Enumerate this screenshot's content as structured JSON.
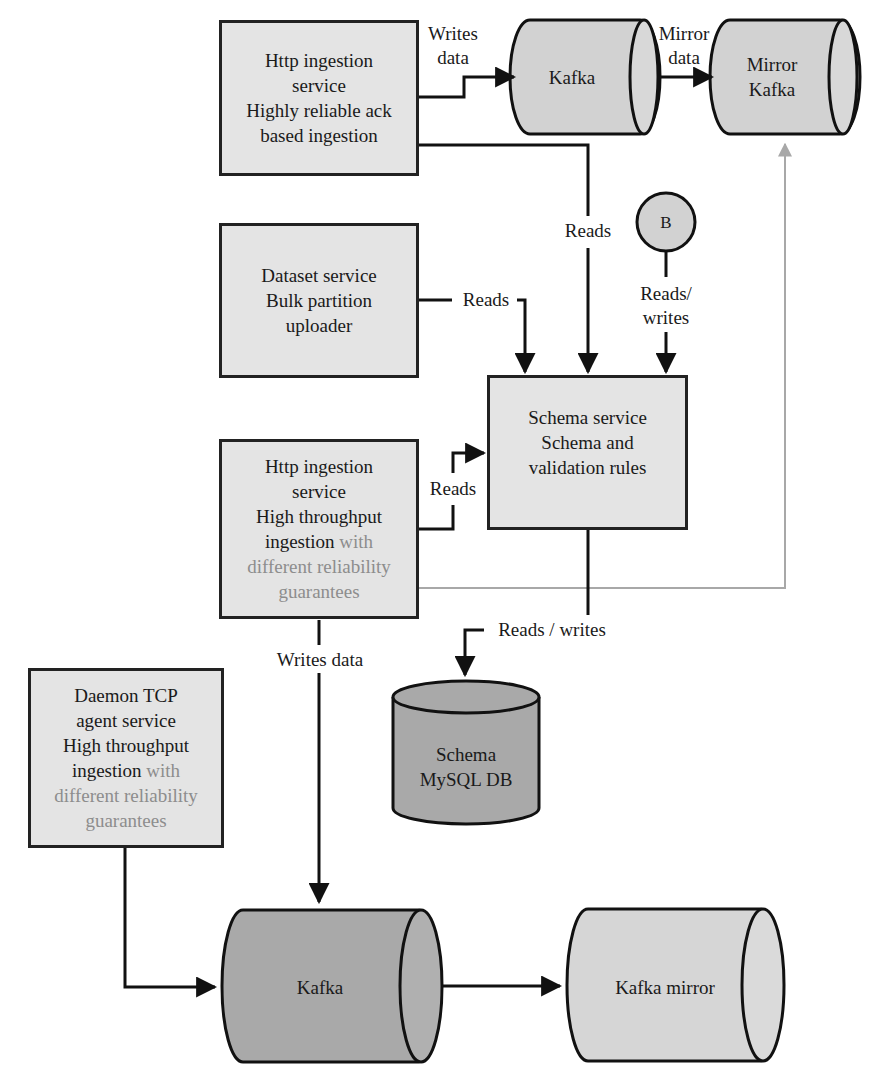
{
  "nodes": {
    "http_reliable": {
      "lines": [
        "Http ingestion",
        "service",
        "Highly reliable ack",
        "based ingestion"
      ]
    },
    "kafka_top": {
      "label": "Kafka"
    },
    "mirror_kafka_top": {
      "line1": "Mirror",
      "line2": "Kafka"
    },
    "dataset_service": {
      "lines": [
        "Dataset service",
        "Bulk partition",
        "uploader"
      ]
    },
    "b_circle": {
      "label": "B"
    },
    "schema_service": {
      "lines": [
        "Schema service",
        "Schema and",
        "validation rules"
      ]
    },
    "http_throughput": {
      "lines": [
        "Http ingestion",
        "service",
        "High throughput"
      ],
      "mixed_prefix": "ingestion",
      "mixed_suffix": " with",
      "muted_lines": [
        "different reliability",
        "guarantees"
      ]
    },
    "schema_db": {
      "line1": "Schema",
      "line2": "MySQL DB"
    },
    "daemon_tcp": {
      "lines": [
        "Daemon TCP",
        "agent service",
        "High throughput"
      ],
      "mixed_prefix": "ingestion",
      "mixed_suffix": " with",
      "muted_lines": [
        "different reliability",
        "guarantees"
      ]
    },
    "kafka_bottom": {
      "label": "Kafka"
    },
    "kafka_mirror_bottom": {
      "label": "Kafka mirror"
    }
  },
  "edges": {
    "writes_data_top": {
      "line1": "Writes",
      "line2": "data"
    },
    "mirror_data": {
      "line1": "Mirror",
      "line2": "data"
    },
    "reads_http_top": "Reads",
    "reads_dataset": "Reads",
    "reads_writes_b": {
      "line1": "Reads/",
      "line2": "writes"
    },
    "reads_http_mid": "Reads",
    "reads_writes_db": "Reads / writes",
    "writes_data_mid": "Writes data"
  },
  "colors": {
    "box_fill": "#e4e4e4",
    "cylinder_dark": "#a9a9a9",
    "cylinder_light": "#d6d6d6",
    "stroke": "#1a1a1a",
    "muted_text": "#8d8d8d",
    "grey_connector": "#a8a8a8"
  }
}
